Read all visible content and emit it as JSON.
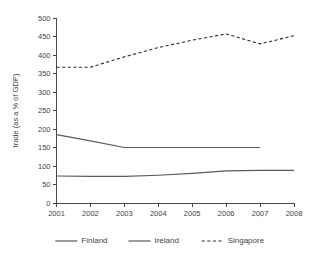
{
  "chart_data": {
    "type": "line",
    "title": "",
    "xlabel": "",
    "ylabel": "trade (as a % of GDP)",
    "categories": [
      "2001",
      "2002",
      "2003",
      "2004",
      "2005",
      "2006",
      "2007",
      "2008"
    ],
    "x": [
      2001,
      2002,
      2003,
      2004,
      2005,
      2006,
      2007,
      2008
    ],
    "ylim": [
      0,
      500
    ],
    "xlim": [
      2001,
      2008
    ],
    "yticks": [
      0,
      50,
      100,
      150,
      200,
      250,
      300,
      350,
      400,
      450,
      500
    ],
    "ytick_labels": [
      "0",
      "50",
      "100",
      "150",
      "200",
      "250",
      "300",
      "350",
      "400",
      "450",
      "500"
    ],
    "grid": false,
    "legend_position": "bottom",
    "series": [
      {
        "name": "Finland",
        "style": "solid",
        "color": "#5a5a5a",
        "x": [
          2001,
          2002,
          2003,
          2004,
          2005,
          2006,
          2007,
          2008
        ],
        "values": [
          73,
          72,
          72,
          75,
          80,
          87,
          88,
          88
        ]
      },
      {
        "name": "Ireland",
        "style": "solid",
        "color": "#5a5a5a",
        "x": [
          2001,
          2002,
          2003,
          2004,
          2005,
          2006,
          2007
        ],
        "values": [
          185,
          168,
          150,
          150,
          150,
          150,
          150
        ]
      },
      {
        "name": "Singapore",
        "style": "dashed",
        "color": "#2e2e2e",
        "x": [
          2001,
          2002,
          2003,
          2004,
          2005,
          2006,
          2007,
          2008
        ],
        "values": [
          367,
          367,
          395,
          420,
          440,
          457,
          430,
          452
        ]
      }
    ]
  },
  "legend": {
    "items": [
      {
        "label": "Finland",
        "style": "solid"
      },
      {
        "label": "Ireland",
        "style": "solid"
      },
      {
        "label": "Singapore",
        "style": "dashed"
      }
    ]
  },
  "axes": {
    "y_title": "trade (as a % of GDP)"
  }
}
